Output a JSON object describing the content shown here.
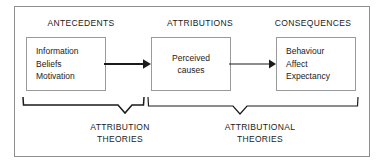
{
  "figure": {
    "columns": [
      {
        "heading": "ANTECEDENTS"
      },
      {
        "heading": "ATTRIBUTIONS"
      },
      {
        "heading": "CONSEQUENCES"
      }
    ],
    "boxes": [
      {
        "id": "antecedents",
        "lines": [
          "Information",
          "Beliefs",
          "Motivation"
        ]
      },
      {
        "id": "attributions",
        "lines": [
          "Perceived",
          "causes"
        ]
      },
      {
        "id": "consequences",
        "lines": [
          "Behaviour",
          "Affect",
          "Expectancy"
        ]
      }
    ],
    "connectors": [
      {
        "id": "arrow-antecedents-to-attributions",
        "icon": "arrow-right-icon"
      },
      {
        "id": "arrow-attributions-to-consequences",
        "icon": "arrow-right-icon"
      }
    ],
    "braces": [
      {
        "id": "brace-attribution-theories",
        "icon": "brace-down-icon",
        "caption_line_1": "ATTRIBUTION",
        "caption_line_2": "THEORIES"
      },
      {
        "id": "brace-attributional-theories",
        "icon": "brace-down-icon",
        "caption_line_1": "ATTRIBUTIONAL",
        "caption_line_2": "THEORIES"
      }
    ],
    "colors": {
      "frame_border": "#8e8e8e",
      "box_border": "#9a9a9a",
      "line": "#1b1b1b",
      "text": "#1b1b1b",
      "background": "#ffffff"
    }
  }
}
